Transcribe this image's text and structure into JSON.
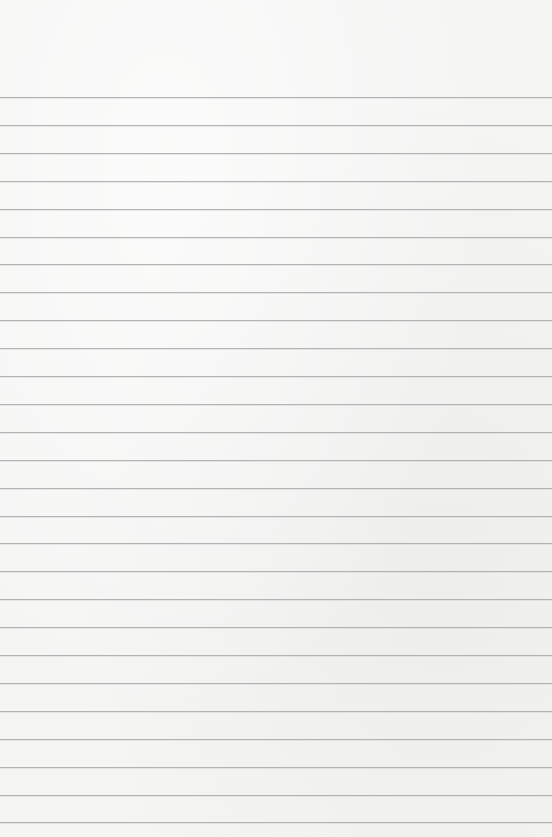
{
  "sheet": {
    "type": "blank ruled paper",
    "background_color": "#f5f5f4",
    "rule_color": "#a8a8a8",
    "first_rule_y": 97,
    "rule_spacing": 27.9,
    "rule_count": 27,
    "text": ""
  }
}
